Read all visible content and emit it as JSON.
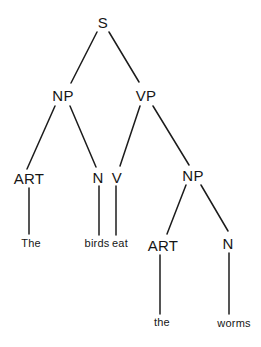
{
  "diagram": {
    "type": "syntax-tree",
    "sentence": "The birds eat the worms",
    "line_color": "#1c1c1c",
    "nodes": {
      "s": {
        "label": "S"
      },
      "np1": {
        "label": "NP"
      },
      "vp": {
        "label": "VP"
      },
      "art1": {
        "label": "ART"
      },
      "n1": {
        "label": "N"
      },
      "v": {
        "label": "V"
      },
      "np2": {
        "label": "NP"
      },
      "art2": {
        "label": "ART"
      },
      "n2": {
        "label": "N"
      }
    },
    "terminals": {
      "the1": {
        "label": "The",
        "parent": "ART"
      },
      "birds": {
        "label": "birds",
        "parent": "N"
      },
      "eat": {
        "label": "eat",
        "parent": "V"
      },
      "the2": {
        "label": "the",
        "parent": "ART"
      },
      "worms": {
        "label": "worms",
        "parent": "N"
      }
    },
    "edges": [
      [
        "S",
        "NP"
      ],
      [
        "S",
        "VP"
      ],
      [
        "NP",
        "ART"
      ],
      [
        "NP",
        "N"
      ],
      [
        "VP",
        "V"
      ],
      [
        "VP",
        "NP2"
      ],
      [
        "ART",
        "The"
      ],
      [
        "N",
        "birds"
      ],
      [
        "V",
        "eat"
      ],
      [
        "NP2",
        "ART2"
      ],
      [
        "NP2",
        "N2"
      ],
      [
        "ART2",
        "the"
      ],
      [
        "N2",
        "worms"
      ]
    ]
  }
}
